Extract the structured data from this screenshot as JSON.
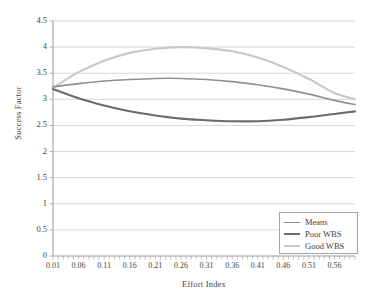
{
  "chart_data": {
    "type": "line",
    "title": "",
    "xlabel": "Effort Index",
    "ylabel": "Success Factor",
    "xlim": [
      0.01,
      0.6
    ],
    "ylim": [
      0,
      4.5
    ],
    "yticks": [
      "0",
      "0.5",
      "1",
      "1.5",
      "2",
      "2.5",
      "3",
      "3.5",
      "4",
      "4.5"
    ],
    "ytick_values": [
      0,
      0.5,
      1,
      1.5,
      2,
      2.5,
      3,
      3.5,
      4,
      4.5
    ],
    "xticks": [
      "0.01",
      "0.06",
      "0.11",
      "0.16",
      "0.21",
      "0.26",
      "0.31",
      "0.36",
      "0.41",
      "0.46",
      "0.51",
      "0.56"
    ],
    "xtick_values": [
      0.01,
      0.06,
      0.11,
      0.16,
      0.21,
      0.26,
      0.31,
      0.36,
      0.41,
      0.46,
      0.51,
      0.56
    ],
    "grid": "horizontal",
    "legend_position": "bottom-right",
    "x": [
      0.01,
      0.06,
      0.11,
      0.16,
      0.21,
      0.26,
      0.31,
      0.36,
      0.41,
      0.46,
      0.51,
      0.56,
      0.6
    ],
    "series": [
      {
        "name": "Means",
        "color": "#8f8f8f",
        "width": 1.6,
        "values": [
          3.24,
          3.3,
          3.35,
          3.38,
          3.4,
          3.4,
          3.38,
          3.34,
          3.28,
          3.2,
          3.1,
          2.98,
          2.9
        ]
      },
      {
        "name": "Poor WBS",
        "color": "#6b6b6b",
        "width": 2.1,
        "values": [
          3.2,
          3.02,
          2.88,
          2.77,
          2.69,
          2.63,
          2.6,
          2.58,
          2.58,
          2.61,
          2.66,
          2.72,
          2.77
        ]
      },
      {
        "name": "Good WBS",
        "color": "#c8c8c8",
        "width": 2.1,
        "values": [
          3.22,
          3.52,
          3.74,
          3.89,
          3.97,
          4.0,
          3.98,
          3.92,
          3.8,
          3.62,
          3.39,
          3.12,
          3.0
        ]
      }
    ]
  },
  "legend": {
    "items": [
      {
        "label": "Means"
      },
      {
        "label": "Poor WBS"
      },
      {
        "label": "Good WBS"
      }
    ]
  }
}
